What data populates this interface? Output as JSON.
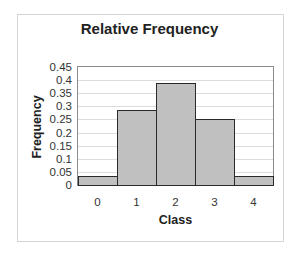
{
  "chart_data": {
    "type": "bar",
    "title": "Relative Frequency",
    "xlabel": "Class",
    "ylabel": "Frequency",
    "categories": [
      "0",
      "1",
      "2",
      "3",
      "4"
    ],
    "values": [
      0.035,
      0.285,
      0.39,
      0.25,
      0.035
    ],
    "ylim": [
      0,
      0.45
    ],
    "yticks": [
      "0",
      "0.05",
      "0.1",
      "0.15",
      "0.2",
      "0.25",
      "0.3",
      "0.35",
      "0.4",
      "0.45"
    ],
    "grid": true,
    "legend": "none",
    "bar_gap": 0,
    "colors": {
      "bar_fill": "#c0c0c0",
      "bar_edge": "#2a2a2a",
      "grid": "#dcdcdc",
      "plot_border": "#8c8c8c"
    }
  }
}
